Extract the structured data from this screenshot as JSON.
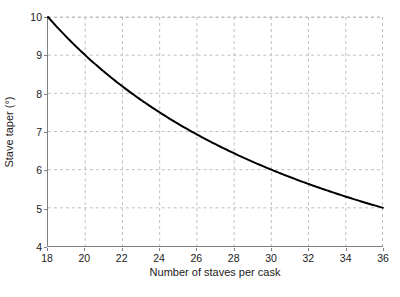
{
  "chart_data": {
    "type": "line",
    "title": "",
    "xlabel": "Number of staves per cask",
    "ylabel": "Stave taper (°)",
    "xlim": [
      18,
      36
    ],
    "ylim": [
      4,
      10
    ],
    "xticks": [
      18,
      20,
      22,
      24,
      26,
      28,
      30,
      32,
      34,
      36
    ],
    "yticks": [
      4,
      5,
      6,
      7,
      8,
      9,
      10
    ],
    "xtick_labels": [
      "18",
      "20",
      "22",
      "24",
      "26",
      "28",
      "30",
      "32",
      "34",
      "36"
    ],
    "ytick_labels": [
      "4",
      "5",
      "6",
      "7",
      "8",
      "9",
      "10"
    ],
    "grid": true,
    "grid_style": "dashed",
    "grid_color": "#bfbfbf",
    "legend": null,
    "line_color": "#000000",
    "line_width": 2,
    "series": [
      {
        "name": "Stave taper",
        "relation": "y = 180 / x",
        "x": [
          18,
          19,
          20,
          21,
          22,
          23,
          24,
          25,
          26,
          27,
          28,
          29,
          30,
          31,
          32,
          33,
          34,
          35,
          36
        ],
        "values": [
          10.0,
          9.47,
          9.0,
          8.57,
          8.18,
          7.83,
          7.5,
          7.2,
          6.92,
          6.67,
          6.43,
          6.21,
          6.0,
          5.81,
          5.63,
          5.45,
          5.29,
          5.14,
          5.0
        ]
      }
    ]
  },
  "axes": {
    "y_title": "Stave taper (°)",
    "x_title": "Number of staves per cask"
  }
}
